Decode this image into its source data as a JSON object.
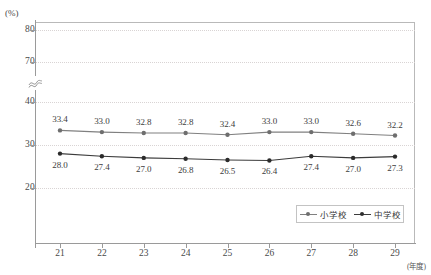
{
  "chart_data": {
    "type": "line",
    "title": "",
    "subtitle": "",
    "xlabel": "(年度)",
    "ylabel": "(%)",
    "categories": [
      "21",
      "22",
      "23",
      "24",
      "25",
      "26",
      "27",
      "28",
      "29"
    ],
    "yticks": [
      "80",
      "70",
      "40",
      "30",
      "20"
    ],
    "ylim": [
      15,
      85
    ],
    "y_axis_break": true,
    "y_axis_break_symbol": "≈",
    "grid": "horizontal-dotted",
    "legend_position": "inside-bottom-right",
    "series": [
      {
        "name": "小学校",
        "color": "#808080",
        "marker": "circle",
        "values": [
          33.4,
          33.0,
          32.8,
          32.8,
          32.4,
          33.0,
          33.0,
          32.6,
          32.2
        ],
        "labels": [
          "33.4",
          "33.0",
          "32.8",
          "32.8",
          "32.4",
          "33.0",
          "33.0",
          "32.6",
          "32.2"
        ],
        "label_position": "above"
      },
      {
        "name": "中学校",
        "color": "#3c3c3c",
        "marker": "circle",
        "values": [
          28.0,
          27.4,
          27.0,
          26.8,
          26.5,
          26.4,
          27.4,
          27.0,
          27.3
        ],
        "labels": [
          "28.0",
          "27.4",
          "27.0",
          "26.8",
          "26.5",
          "26.4",
          "27.4",
          "27.0",
          "27.3"
        ],
        "label_position": "below"
      }
    ]
  },
  "axis": {
    "unit_y": "(%)",
    "unit_x": "(年度)"
  },
  "legend": {
    "items": [
      {
        "label": "小学校",
        "color": "#808080"
      },
      {
        "label": "中学校",
        "color": "#3c3c3c"
      }
    ]
  }
}
